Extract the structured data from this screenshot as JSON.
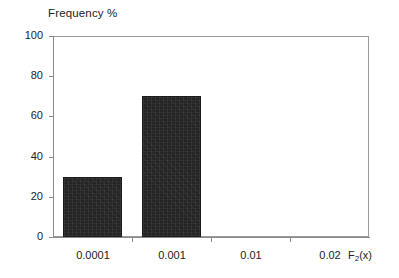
{
  "chart_data": {
    "type": "bar",
    "title": "Frequency %",
    "xlabel": "F2(x)",
    "xlabel_base": "F",
    "xlabel_sub": "2",
    "xlabel_tail": "(x)",
    "ylabel": "",
    "categories": [
      "0.0001",
      "0.001",
      "0.01",
      "0.02"
    ],
    "values": [
      30,
      70,
      0,
      0
    ],
    "series": [
      {
        "name": "Frequency %",
        "values": [
          30,
          70,
          0,
          0
        ]
      }
    ],
    "ylim": [
      0,
      100
    ],
    "yticks": [
      0,
      20,
      40,
      60,
      80,
      100
    ],
    "ytick_labels": [
      "0",
      "20",
      "40",
      "60",
      "80",
      "100"
    ],
    "xtick_labels": [
      "0.0001",
      "0.001",
      "0.01",
      "0.02"
    ],
    "grid": false,
    "legend": false,
    "legend_position": "none",
    "bar_color": "#242424",
    "axis_color": "#8a8a8a",
    "background_color": "#ffffff",
    "text_color": "#222222"
  },
  "figure": {
    "title_text": "Frequency %"
  }
}
